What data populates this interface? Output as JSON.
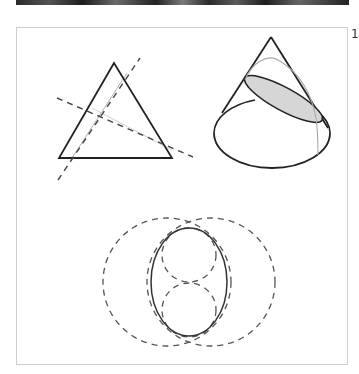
{
  "figure": {
    "number_label": "1",
    "panels": [
      {
        "id": "triangle",
        "description": "Triangle with two dashed lines and a faint cevian/line"
      },
      {
        "id": "cone",
        "description": "Cone with shaded elliptical cross-section"
      },
      {
        "id": "circles",
        "description": "Solid ellipse tangent to two small dashed circles, inside two large dashed circles"
      }
    ]
  },
  "colors": {
    "stroke": "#222222",
    "dashed": "#666666",
    "faint": "#b5b5b5",
    "section_fill": "#d6d6d6",
    "frame": "#cfcfcf"
  }
}
